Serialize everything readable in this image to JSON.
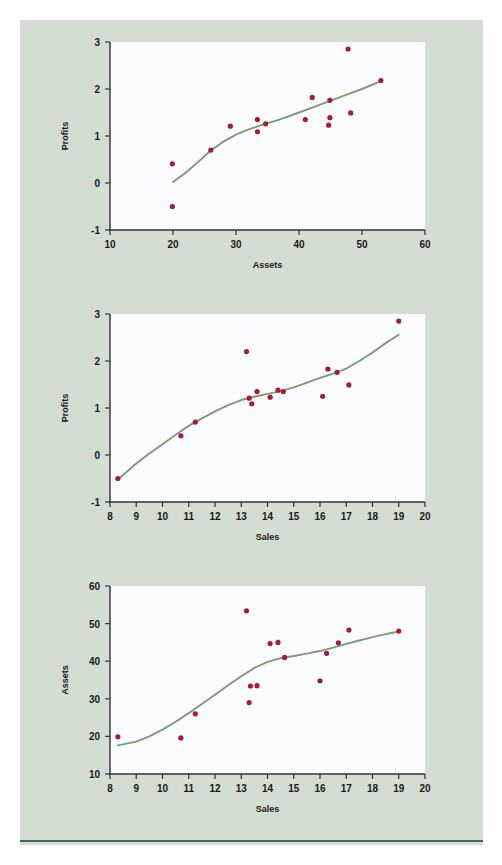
{
  "page": {
    "background_color": "#ffffff",
    "panel_color": "#d3ddd1",
    "rule_color": "#3f6b47",
    "top_text_remnant": "",
    "point_color": "#a81b34",
    "curve_color": "#7d9a79",
    "plot_bg_color": "#fbfcfd"
  },
  "chart_data": [
    {
      "type": "scatter",
      "id": "assets-vs-profits",
      "title": "",
      "xlabel": "Assets",
      "ylabel": "Profits",
      "xlim": [
        10,
        60
      ],
      "ylim": [
        -1,
        3
      ],
      "xticks": [
        10,
        20,
        30,
        40,
        50,
        60
      ],
      "yticks": [
        -1,
        0,
        1,
        2,
        3
      ],
      "xtick_labels": [
        "10",
        "20",
        "30",
        "40",
        "50",
        "60"
      ],
      "ytick_labels": [
        "-1",
        "0",
        "1",
        "2",
        "3"
      ],
      "grid": false,
      "legend": "none",
      "points": [
        {
          "x": 19.9,
          "y": 0.41
        },
        {
          "x": 19.9,
          "y": -0.5
        },
        {
          "x": 26.0,
          "y": 0.7
        },
        {
          "x": 29.1,
          "y": 1.21
        },
        {
          "x": 33.4,
          "y": 1.35
        },
        {
          "x": 33.4,
          "y": 1.09
        },
        {
          "x": 34.7,
          "y": 1.26
        },
        {
          "x": 41.0,
          "y": 1.35
        },
        {
          "x": 42.1,
          "y": 1.82
        },
        {
          "x": 44.7,
          "y": 1.23
        },
        {
          "x": 44.9,
          "y": 1.39
        },
        {
          "x": 44.9,
          "y": 1.76
        },
        {
          "x": 47.8,
          "y": 2.85
        },
        {
          "x": 48.2,
          "y": 1.49
        },
        {
          "x": 53.0,
          "y": 2.18
        }
      ],
      "smooth_curve": [
        {
          "x": 20.0,
          "y": 0.02
        },
        {
          "x": 22.0,
          "y": 0.22
        },
        {
          "x": 24.0,
          "y": 0.45
        },
        {
          "x": 26.0,
          "y": 0.69
        },
        {
          "x": 28.0,
          "y": 0.88
        },
        {
          "x": 30.0,
          "y": 1.03
        },
        {
          "x": 32.0,
          "y": 1.14
        },
        {
          "x": 34.0,
          "y": 1.23
        },
        {
          "x": 36.0,
          "y": 1.31
        },
        {
          "x": 38.0,
          "y": 1.4
        },
        {
          "x": 40.0,
          "y": 1.5
        },
        {
          "x": 42.0,
          "y": 1.6
        },
        {
          "x": 44.0,
          "y": 1.7
        },
        {
          "x": 46.0,
          "y": 1.8
        },
        {
          "x": 48.0,
          "y": 1.9
        },
        {
          "x": 50.0,
          "y": 2.0
        },
        {
          "x": 53.0,
          "y": 2.17
        }
      ]
    },
    {
      "type": "scatter",
      "id": "sales-vs-profits",
      "title": "",
      "xlabel": "Sales",
      "ylabel": "Profits",
      "xlim": [
        8,
        20
      ],
      "ylim": [
        -1,
        3
      ],
      "xticks": [
        8,
        9,
        10,
        11,
        12,
        13,
        14,
        15,
        16,
        17,
        18,
        19,
        20
      ],
      "yticks": [
        -1,
        0,
        1,
        2,
        3
      ],
      "xtick_labels": [
        "8",
        "9",
        "10",
        "11",
        "12",
        "13",
        "14",
        "15",
        "16",
        "17",
        "18",
        "19",
        "20"
      ],
      "ytick_labels": [
        "-1",
        "0",
        "1",
        "2",
        "3"
      ],
      "grid": false,
      "legend": "none",
      "points": [
        {
          "x": 8.3,
          "y": -0.5
        },
        {
          "x": 10.7,
          "y": 0.41
        },
        {
          "x": 11.25,
          "y": 0.7
        },
        {
          "x": 13.2,
          "y": 2.2
        },
        {
          "x": 13.3,
          "y": 1.21
        },
        {
          "x": 13.4,
          "y": 1.09
        },
        {
          "x": 13.6,
          "y": 1.35
        },
        {
          "x": 14.1,
          "y": 1.23
        },
        {
          "x": 14.4,
          "y": 1.38
        },
        {
          "x": 14.6,
          "y": 1.35
        },
        {
          "x": 16.1,
          "y": 1.25
        },
        {
          "x": 16.3,
          "y": 1.83
        },
        {
          "x": 16.65,
          "y": 1.76
        },
        {
          "x": 17.1,
          "y": 1.49
        },
        {
          "x": 19.0,
          "y": 2.85
        }
      ],
      "smooth_curve": [
        {
          "x": 8.3,
          "y": -0.52
        },
        {
          "x": 9.0,
          "y": -0.18
        },
        {
          "x": 9.5,
          "y": 0.03
        },
        {
          "x": 10.0,
          "y": 0.23
        },
        {
          "x": 10.5,
          "y": 0.43
        },
        {
          "x": 11.0,
          "y": 0.62
        },
        {
          "x": 11.5,
          "y": 0.78
        },
        {
          "x": 12.0,
          "y": 0.93
        },
        {
          "x": 12.5,
          "y": 1.06
        },
        {
          "x": 13.0,
          "y": 1.17
        },
        {
          "x": 13.5,
          "y": 1.24
        },
        {
          "x": 14.0,
          "y": 1.3
        },
        {
          "x": 14.5,
          "y": 1.36
        },
        {
          "x": 15.0,
          "y": 1.44
        },
        {
          "x": 15.5,
          "y": 1.54
        },
        {
          "x": 16.0,
          "y": 1.64
        },
        {
          "x": 16.5,
          "y": 1.73
        },
        {
          "x": 17.0,
          "y": 1.84
        },
        {
          "x": 17.5,
          "y": 2.0
        },
        {
          "x": 18.0,
          "y": 2.18
        },
        {
          "x": 18.5,
          "y": 2.38
        },
        {
          "x": 19.0,
          "y": 2.56
        }
      ]
    },
    {
      "type": "scatter",
      "id": "sales-vs-assets",
      "title": "",
      "xlabel": "Sales",
      "ylabel": "Assets",
      "xlim": [
        8,
        20
      ],
      "ylim": [
        10,
        60
      ],
      "xticks": [
        8,
        9,
        10,
        11,
        12,
        13,
        14,
        15,
        16,
        17,
        18,
        19,
        20
      ],
      "yticks": [
        10,
        20,
        30,
        40,
        50,
        60
      ],
      "xtick_labels": [
        "8",
        "9",
        "10",
        "11",
        "12",
        "13",
        "14",
        "15",
        "16",
        "17",
        "18",
        "19",
        "20"
      ],
      "ytick_labels": [
        "10",
        "20",
        "30",
        "40",
        "50",
        "60"
      ],
      "grid": false,
      "legend": "none",
      "points": [
        {
          "x": 8.3,
          "y": 19.9
        },
        {
          "x": 10.7,
          "y": 19.6
        },
        {
          "x": 11.25,
          "y": 26.0
        },
        {
          "x": 13.2,
          "y": 53.4
        },
        {
          "x": 13.3,
          "y": 29.0
        },
        {
          "x": 13.35,
          "y": 33.4
        },
        {
          "x": 13.6,
          "y": 33.5
        },
        {
          "x": 14.1,
          "y": 44.7
        },
        {
          "x": 14.4,
          "y": 45.0
        },
        {
          "x": 14.65,
          "y": 41.0
        },
        {
          "x": 16.0,
          "y": 34.8
        },
        {
          "x": 16.25,
          "y": 42.1
        },
        {
          "x": 16.7,
          "y": 44.9
        },
        {
          "x": 17.1,
          "y": 48.3
        },
        {
          "x": 19.0,
          "y": 48.0
        }
      ],
      "smooth_curve": [
        {
          "x": 8.3,
          "y": 17.6
        },
        {
          "x": 9.0,
          "y": 18.6
        },
        {
          "x": 9.5,
          "y": 20.0
        },
        {
          "x": 10.0,
          "y": 21.8
        },
        {
          "x": 10.5,
          "y": 23.9
        },
        {
          "x": 11.0,
          "y": 26.2
        },
        {
          "x": 11.5,
          "y": 28.6
        },
        {
          "x": 12.0,
          "y": 31.1
        },
        {
          "x": 12.5,
          "y": 33.6
        },
        {
          "x": 13.0,
          "y": 36.0
        },
        {
          "x": 13.5,
          "y": 38.2
        },
        {
          "x": 14.0,
          "y": 39.8
        },
        {
          "x": 14.5,
          "y": 40.8
        },
        {
          "x": 15.0,
          "y": 41.4
        },
        {
          "x": 15.5,
          "y": 42.0
        },
        {
          "x": 16.0,
          "y": 42.7
        },
        {
          "x": 16.5,
          "y": 43.6
        },
        {
          "x": 17.0,
          "y": 44.6
        },
        {
          "x": 17.5,
          "y": 45.5
        },
        {
          "x": 18.0,
          "y": 46.4
        },
        {
          "x": 18.5,
          "y": 47.2
        },
        {
          "x": 19.0,
          "y": 47.9
        }
      ]
    }
  ]
}
